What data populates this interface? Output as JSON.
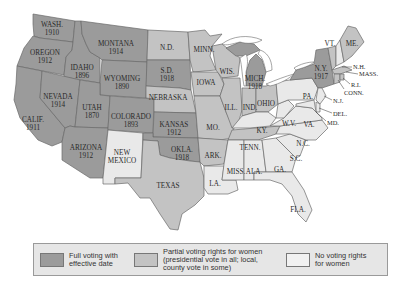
{
  "map": {
    "title": "Woman Suffrage Before the Nineteenth Amendment",
    "colors": {
      "full": "#9b9b9b",
      "partial": "#c3c3c3",
      "none": "#e9e9e9",
      "border": "#6a6a6a"
    },
    "states": [
      {
        "abbr": "WASH.",
        "year": "1910",
        "status": "full"
      },
      {
        "abbr": "OREGON",
        "year": "1912",
        "status": "full"
      },
      {
        "abbr": "CALIF.",
        "year": "1911",
        "status": "full"
      },
      {
        "abbr": "IDAHO",
        "year": "1896",
        "status": "full"
      },
      {
        "abbr": "NEVADA",
        "year": "1914",
        "status": "full"
      },
      {
        "abbr": "MONTANA",
        "year": "1914",
        "status": "full"
      },
      {
        "abbr": "WYOMING",
        "year": "1890",
        "status": "full"
      },
      {
        "abbr": "UTAH",
        "year": "1870",
        "status": "full"
      },
      {
        "abbr": "ARIZONA",
        "year": "1912",
        "status": "full"
      },
      {
        "abbr": "COLORADO",
        "year": "1893",
        "status": "full"
      },
      {
        "abbr": "NEW MEXICO",
        "year": "",
        "status": "none"
      },
      {
        "abbr": "N.D.",
        "year": "",
        "status": "partial"
      },
      {
        "abbr": "S.D.",
        "year": "1918",
        "status": "full"
      },
      {
        "abbr": "NEBRASKA",
        "year": "",
        "status": "partial"
      },
      {
        "abbr": "KANSAS",
        "year": "1912",
        "status": "full"
      },
      {
        "abbr": "OKLA.",
        "year": "1918",
        "status": "full"
      },
      {
        "abbr": "TEXAS",
        "year": "",
        "status": "partial"
      },
      {
        "abbr": "MINN.",
        "year": "",
        "status": "partial"
      },
      {
        "abbr": "IOWA",
        "year": "",
        "status": "partial"
      },
      {
        "abbr": "MO.",
        "year": "",
        "status": "partial"
      },
      {
        "abbr": "ARK.",
        "year": "",
        "status": "partial"
      },
      {
        "abbr": "LA.",
        "year": "",
        "status": "none"
      },
      {
        "abbr": "WIS.",
        "year": "",
        "status": "partial"
      },
      {
        "abbr": "ILL.",
        "year": "",
        "status": "partial"
      },
      {
        "abbr": "MICH.",
        "year": "1918",
        "status": "full"
      },
      {
        "abbr": "IND.",
        "year": "",
        "status": "partial"
      },
      {
        "abbr": "OHIO",
        "year": "",
        "status": "partial"
      },
      {
        "abbr": "KY.",
        "year": "",
        "status": "none"
      },
      {
        "abbr": "TENN.",
        "year": "",
        "status": "partial"
      },
      {
        "abbr": "MISS.",
        "year": "",
        "status": "none"
      },
      {
        "abbr": "ALA.",
        "year": "",
        "status": "none"
      },
      {
        "abbr": "GA.",
        "year": "",
        "status": "none"
      },
      {
        "abbr": "FLA.",
        "year": "",
        "status": "none"
      },
      {
        "abbr": "S.C.",
        "year": "",
        "status": "none"
      },
      {
        "abbr": "N.C.",
        "year": "",
        "status": "none"
      },
      {
        "abbr": "VA.",
        "year": "",
        "status": "none"
      },
      {
        "abbr": "W.V.",
        "year": "",
        "status": "none"
      },
      {
        "abbr": "PA.",
        "year": "",
        "status": "none"
      },
      {
        "abbr": "N.Y.",
        "year": "1917",
        "status": "full"
      },
      {
        "abbr": "VT.",
        "year": "",
        "status": "partial"
      },
      {
        "abbr": "ME.",
        "year": "",
        "status": "partial"
      },
      {
        "abbr": "N.H.",
        "year": "",
        "status": "none"
      },
      {
        "abbr": "MASS.",
        "year": "",
        "status": "partial"
      },
      {
        "abbr": "R.I.",
        "year": "",
        "status": "partial"
      },
      {
        "abbr": "CONN.",
        "year": "",
        "status": "partial"
      },
      {
        "abbr": "N.J.",
        "year": "",
        "status": "none"
      },
      {
        "abbr": "DEL.",
        "year": "",
        "status": "none"
      },
      {
        "abbr": "MD.",
        "year": "",
        "status": "none"
      }
    ],
    "labels": {
      "wash": "WASH.",
      "wash_y": "1910",
      "oregon": "OREGON",
      "oregon_y": "1912",
      "calif": "CALIF.",
      "calif_y": "1911",
      "idaho": "IDAHO",
      "idaho_y": "1896",
      "nevada": "NEVADA",
      "nevada_y": "1914",
      "montana": "MONTANA",
      "montana_y": "1914",
      "wyoming": "WYOMING",
      "wyoming_y": "1890",
      "utah": "UTAH",
      "utah_y": "1870",
      "arizona": "ARIZONA",
      "arizona_y": "1912",
      "colorado": "COLORADO",
      "colorado_y": "1893",
      "nm1": "NEW",
      "nm2": "MEXICO",
      "nd": "N.D.",
      "sd": "S.D.",
      "sd_y": "1918",
      "nebraska": "NEBRASKA",
      "kansas": "KANSAS",
      "kansas_y": "1912",
      "okla": "OKLA.",
      "okla_y": "1918",
      "texas": "TEXAS",
      "minn": "MINN.",
      "iowa": "IOWA",
      "mo": "MO.",
      "ark": "ARK.",
      "la": "LA.",
      "wis": "WIS.",
      "ill": "ILL.",
      "mich": "MICH.",
      "mich_y": "1918",
      "ind": "IND.",
      "ohio": "OHIO",
      "ky": "KY.",
      "tenn": "TENN.",
      "miss": "MISS.",
      "ala": "ALA.",
      "ga": "GA.",
      "fla": "FLA.",
      "sc": "S.C.",
      "nc": "N.C.",
      "va": "VA.",
      "wv": "W.V.",
      "pa": "PA.",
      "ny": "N.Y.",
      "ny_y": "1917",
      "vt": "VT.",
      "me": "ME.",
      "nh": "N.H.",
      "mass": "MASS.",
      "ri": "R.I.",
      "conn": "CONN.",
      "nj": "N.J.",
      "del": "DEL.",
      "md": "MD."
    }
  },
  "legend": {
    "items": [
      {
        "label_line1": "Full voting with",
        "label_line2": "effective date",
        "label_line3": "",
        "swatch": "full"
      },
      {
        "label_line1": "Partial voting rights for women",
        "label_line2": "(presidential vote in all; local,",
        "label_line3": "county vote in some)",
        "swatch": "partial"
      },
      {
        "label_line1": "No voting rights",
        "label_line2": "for women",
        "label_line3": "",
        "swatch": "none"
      }
    ]
  }
}
